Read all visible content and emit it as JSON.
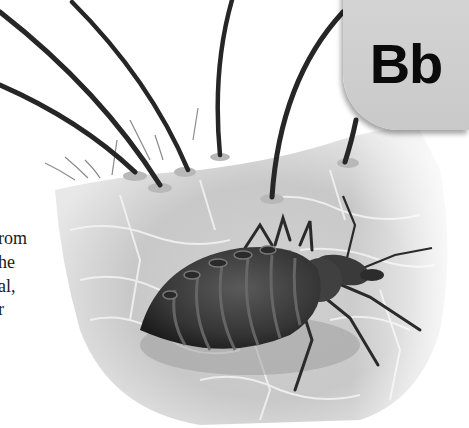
{
  "page": {
    "letter_badge": {
      "text": "Bb",
      "background": "#cfcfcf",
      "color": "#0a0a0a"
    },
    "cut_off_text": [
      {
        "text": "rom",
        "top": 229
      },
      {
        "text": "he",
        "top": 253
      },
      {
        "text": "al,",
        "top": 277
      },
      {
        "text": "r",
        "top": 300
      }
    ],
    "illustration": {
      "subject": "bedbug on skin with hairs",
      "palette": {
        "skin_light": "#e6e6e6",
        "skin_mid": "#c4c4c4",
        "hair": "#2a2a2a",
        "bug_body": "#3a3a3a",
        "bug_dark": "#1e1e1e"
      }
    }
  }
}
